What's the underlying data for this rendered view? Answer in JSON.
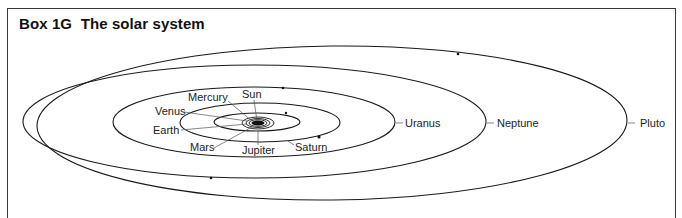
{
  "box": {
    "title": "Box 1G  The solar system"
  },
  "labels": {
    "sun": "Sun",
    "mercury": "Mercury",
    "venus": "Venus",
    "earth": "Earth",
    "mars": "Mars",
    "jupiter": "Jupiter",
    "saturn": "Saturn",
    "uranus": "Uranus",
    "neptune": "Neptune",
    "pluto": "Pluto"
  },
  "colors": {
    "line": "#1a1a1a",
    "frame": "#3a3a3a",
    "background": "#ffffff"
  }
}
